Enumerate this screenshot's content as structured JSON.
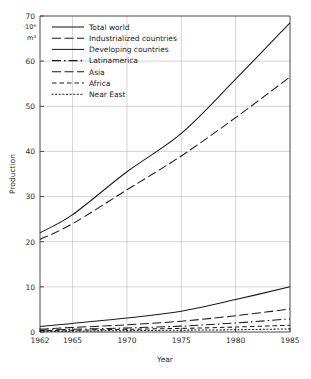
{
  "chart_data": {
    "type": "line",
    "title": "",
    "xlabel": "Year",
    "ylabel": "Production",
    "yunit": "·10⁶ m³",
    "xlim": [
      1962,
      1985
    ],
    "ylim": [
      0,
      70
    ],
    "grid": true,
    "legend_position": "top-left",
    "xticks": [
      1962,
      1965,
      1970,
      1975,
      1980,
      1985
    ],
    "yticks": [
      0,
      10,
      20,
      30,
      40,
      50,
      60,
      70
    ],
    "x": [
      1962,
      1965,
      1970,
      1975,
      1980,
      1985
    ],
    "series": [
      {
        "name": "Total world",
        "style": "solid",
        "values": [
          22.0,
          26.0,
          35.5,
          44.0,
          56.0,
          68.5
        ]
      },
      {
        "name": "Industrialized countries",
        "style": "long-dash",
        "values": [
          20.5,
          24.0,
          31.5,
          39.0,
          47.5,
          56.5
        ]
      },
      {
        "name": "Developing countries",
        "style": "solid",
        "values": [
          1.2,
          1.9,
          3.1,
          4.6,
          7.2,
          10.0
        ]
      },
      {
        "name": "Latinamerica",
        "style": "dash-dot",
        "values": [
          0.4,
          0.6,
          0.9,
          1.3,
          2.0,
          2.9
        ]
      },
      {
        "name": "Asia",
        "style": "long-dash",
        "values": [
          0.6,
          1.0,
          1.6,
          2.4,
          3.6,
          5.1
        ]
      },
      {
        "name": "Africa",
        "style": "short-dash",
        "values": [
          0.3,
          0.4,
          0.6,
          0.8,
          1.1,
          1.5
        ]
      },
      {
        "name": "Near East",
        "style": "dotted",
        "values": [
          0.15,
          0.2,
          0.3,
          0.4,
          0.5,
          0.7
        ]
      }
    ]
  },
  "axes": {
    "ylabel": "Production",
    "xlabel": "Year",
    "unit": "·10⁶ m³",
    "unit_line1": "·10⁶",
    "unit_line2": "m³",
    "yticks": [
      "0",
      "10",
      "20",
      "30",
      "40",
      "50",
      "60",
      "70"
    ],
    "xticks": [
      "1962",
      "1965",
      "1970",
      "1975",
      "1980",
      "1985"
    ]
  },
  "legend": {
    "items": [
      {
        "label": "Total world"
      },
      {
        "label": "Industrialized countries"
      },
      {
        "label": "Developing countries"
      },
      {
        "label": "Latinamerica"
      },
      {
        "label": "Asia"
      },
      {
        "label": "Africa"
      },
      {
        "label": "Near East"
      }
    ]
  },
  "colors": {
    "ink": "#1a1a1a",
    "grid": "#b8b8b8",
    "axis": "#4a4a4a",
    "background": "#ffffff"
  }
}
